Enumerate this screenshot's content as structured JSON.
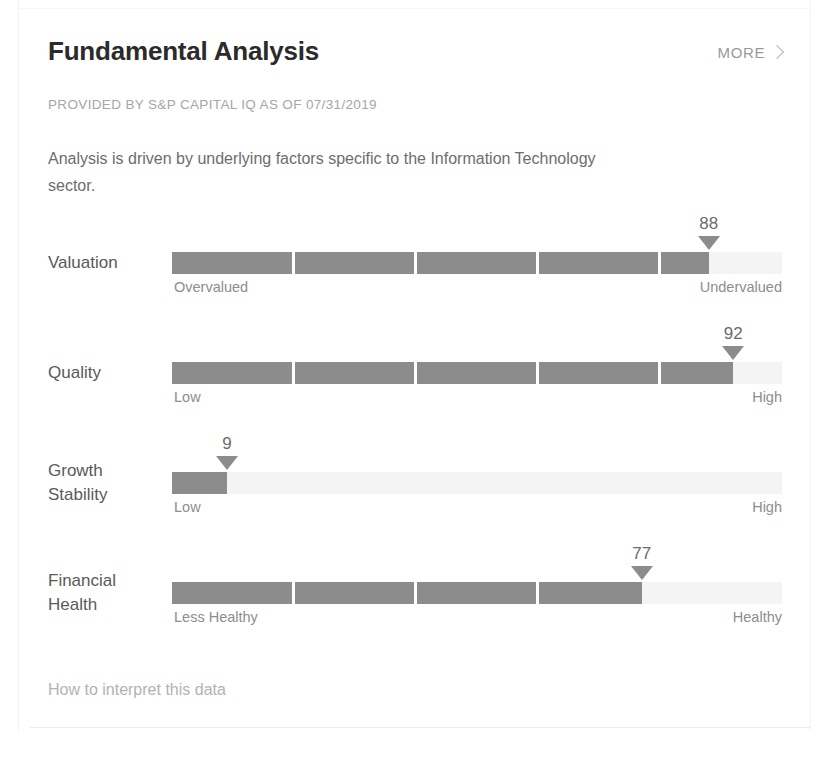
{
  "header": {
    "title": "Fundamental Analysis",
    "more_label": "MORE",
    "more_icon": "chevron-right-icon"
  },
  "provided_by": "PROVIDED BY S&P CAPITAL IQ AS OF 07/31/2019",
  "description": "Analysis is driven by underlying factors specific to the Information Technology sector.",
  "footer": {
    "help_link": "How to interpret this data"
  },
  "colors": {
    "fill": "#8c8c8c",
    "track": "#f4f4f4",
    "title": "#2b2b2b",
    "muted": "#a6a6a6"
  },
  "chart_data": {
    "type": "bar",
    "title": "Fundamental Analysis",
    "subtitle": "PROVIDED BY S&P CAPITAL IQ AS OF 07/31/2019",
    "xlabel": "",
    "ylabel": "",
    "xlim": [
      0,
      100
    ],
    "grid": false,
    "legend": "none",
    "orientation": "horizontal",
    "segments": 5,
    "categories": [
      "Valuation",
      "Quality",
      "Growth Stability",
      "Financial Health"
    ],
    "values": [
      88,
      92,
      9,
      77
    ],
    "series": [
      {
        "name": "Score",
        "values": [
          88,
          92,
          9,
          77
        ]
      }
    ],
    "annotations": [
      "88",
      "92",
      "9",
      "77"
    ],
    "metrics": [
      {
        "name": "Valuation",
        "name_line1": "Valuation",
        "name_line2": "",
        "value": 88,
        "value_label": "88",
        "left_cap": "Overvalued",
        "right_cap": "Undervalued"
      },
      {
        "name": "Quality",
        "name_line1": "Quality",
        "name_line2": "",
        "value": 92,
        "value_label": "92",
        "left_cap": "Low",
        "right_cap": "High"
      },
      {
        "name": "Growth Stability",
        "name_line1": "Growth",
        "name_line2": "Stability",
        "value": 9,
        "value_label": "9",
        "left_cap": "Low",
        "right_cap": "High"
      },
      {
        "name": "Financial Health",
        "name_line1": "Financial",
        "name_line2": "Health",
        "value": 77,
        "value_label": "77",
        "left_cap": "Less Healthy",
        "right_cap": "Healthy"
      }
    ]
  }
}
